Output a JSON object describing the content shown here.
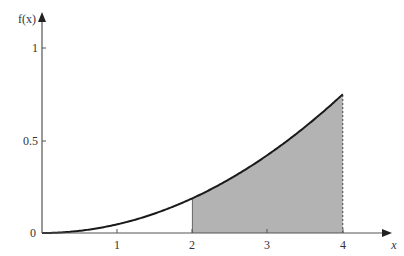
{
  "chart_data": {
    "type": "area",
    "title": "",
    "xlabel": "x",
    "ylabel": "f(x)",
    "function": "f(x) = 3x^2/64",
    "x": [
      0,
      0.5,
      1,
      1.5,
      2,
      2.5,
      3,
      3.5,
      4
    ],
    "values": [
      0,
      0.0117,
      0.0469,
      0.1055,
      0.1875,
      0.293,
      0.4219,
      0.5742,
      0.75
    ],
    "shaded_region": {
      "x_from": 2,
      "x_to": 4,
      "color": "#b3b3b3"
    },
    "xlim": [
      0,
      4.8
    ],
    "ylim": [
      0,
      1.1
    ],
    "x_ticks": [
      "1",
      "2",
      "3",
      "4"
    ],
    "y_ticks": [
      "0.5",
      "1"
    ],
    "origin_label": "0",
    "grid": false,
    "legend": null
  },
  "labels": {
    "origin": "0",
    "x1": "1",
    "x2": "2",
    "x3": "3",
    "x4": "4",
    "y05": "0.5",
    "y1": "1",
    "xaxis": "x",
    "yaxis": "f(x)"
  },
  "colors": {
    "shade": "#b3b3b3",
    "curve": "#1a1a1a",
    "axis": "#555555"
  }
}
